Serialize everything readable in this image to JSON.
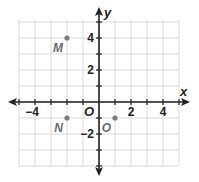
{
  "chart_data": {
    "type": "scatter",
    "title": "",
    "xlabel": "x",
    "ylabel": "y",
    "origin_label": "O",
    "xlim": [
      -5,
      5
    ],
    "ylim": [
      -4,
      5
    ],
    "grid": true,
    "x_tick_labels": [
      {
        "value": -4,
        "text": "−4"
      },
      {
        "value": 2,
        "text": "2"
      },
      {
        "value": 4,
        "text": "4"
      }
    ],
    "y_tick_labels": [
      {
        "value": 4,
        "text": "4"
      },
      {
        "value": 2,
        "text": "2"
      },
      {
        "value": -2,
        "text": "−2"
      }
    ],
    "points": [
      {
        "label": "M",
        "x": -2,
        "y": 4
      },
      {
        "label": "N",
        "x": -2,
        "y": -1
      },
      {
        "label": "O",
        "x": 1,
        "y": -1
      }
    ],
    "colors": {
      "grid": "#d9d9d9",
      "axis": "#222222",
      "point": "#7a7a7a",
      "point_label": "#6b6b6b"
    }
  }
}
